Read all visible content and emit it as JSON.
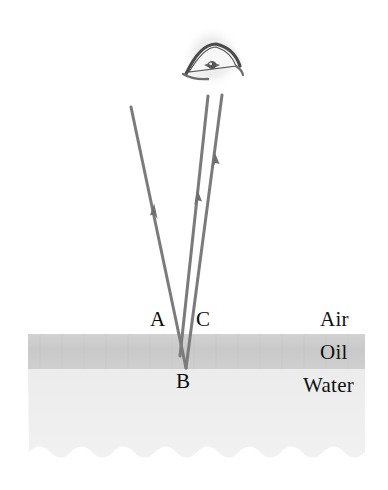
{
  "figure": {
    "width": 388,
    "height": 490,
    "background": "#ffffff"
  },
  "colors": {
    "ray": "#7b7b7b",
    "oil_band": "#cdcdcd",
    "water_band": "#ededed",
    "label_text": "#111111",
    "eye_dark": "#3a3a3a",
    "eye_halo": "#e8e8e8"
  },
  "media_labels": [
    {
      "id": "air",
      "text": "Air",
      "x": 320,
      "y": 309
    },
    {
      "id": "oil",
      "text": "Oil",
      "x": 320,
      "y": 342
    },
    {
      "id": "water",
      "text": "Water",
      "x": 303,
      "y": 375
    }
  ],
  "point_labels": [
    {
      "id": "A",
      "text": "A",
      "x": 150,
      "y": 309
    },
    {
      "id": "C",
      "text": "C",
      "x": 196,
      "y": 309
    },
    {
      "id": "B",
      "text": "B",
      "x": 176,
      "y": 371
    }
  ],
  "layers": {
    "oil": {
      "x": 28,
      "y": 334,
      "width": 337,
      "height": 35,
      "fill": "#cdcdcd"
    },
    "water": {
      "x": 28,
      "y": 369,
      "width": 337,
      "height": 92,
      "fill": "#ededed",
      "bottom_edge": "wavy"
    }
  },
  "rays": [
    {
      "id": "incident-ray",
      "name": "incident ray A",
      "from": {
        "x": 131,
        "y": 107
      },
      "to": {
        "x": 186,
        "y": 368
      },
      "direction": "downward",
      "arrow_at": {
        "x": 155,
        "y": 212
      },
      "stroke": "#7b7b7b",
      "width": 3
    },
    {
      "id": "reflected-ray-oil-surface",
      "name": "ray reflected at oil surface toward eye",
      "from": {
        "x": 180,
        "y": 355
      },
      "to": {
        "x": 208,
        "y": 96
      },
      "direction": "upward",
      "arrow_at": {
        "x": 196,
        "y": 200
      },
      "stroke": "#7b7b7b",
      "width": 3
    },
    {
      "id": "reflected-ray-water-surface",
      "name": "ray reflected at oil-water interface (point B) toward eye",
      "from": {
        "x": 186,
        "y": 368
      },
      "to": {
        "x": 222,
        "y": 95
      },
      "direction": "upward",
      "arrow_at": {
        "x": 213,
        "y": 163
      },
      "stroke": "#7b7b7b",
      "width": 3
    }
  ],
  "observer": {
    "name": "eye",
    "center": {
      "x": 212,
      "y": 57
    },
    "description": "stylized human eye viewing the reflected rays"
  }
}
